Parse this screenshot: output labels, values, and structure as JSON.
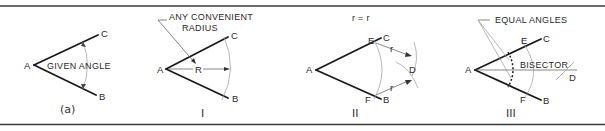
{
  "figure": {
    "panels": [
      {
        "id": "a",
        "caption": "(a)",
        "points": {
          "A": "A",
          "B": "B",
          "C": "C"
        },
        "label": "GIVEN ANGLE"
      },
      {
        "id": "I",
        "caption": "I",
        "points": {
          "A": "A",
          "B": "B",
          "C": "C"
        },
        "radius_label": "R",
        "note_line1": "ANY CONVENIENT",
        "note_line2": "RADIUS"
      },
      {
        "id": "II",
        "caption": "II",
        "points": {
          "A": "A",
          "B": "B",
          "C": "C",
          "D": "D",
          "E": "E",
          "F": "F"
        },
        "equation": "r = r",
        "radius_label": "r"
      },
      {
        "id": "III",
        "caption": "III",
        "points": {
          "A": "A",
          "B": "B",
          "C": "C",
          "D": "D",
          "E": "E",
          "F": "F"
        },
        "note": "EQUAL ANGLES",
        "bisector_label": "BISECTOR"
      }
    ]
  },
  "colors": {
    "ink": "#1a1a1a",
    "construction": "#999999",
    "background": "#ffffff"
  }
}
